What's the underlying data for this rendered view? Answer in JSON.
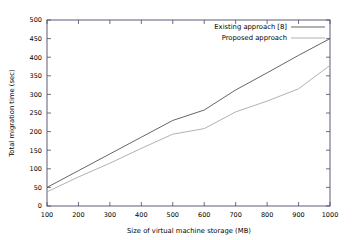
{
  "chart_data": {
    "type": "line",
    "title": "",
    "xlabel": "Size of virtual machine storage (MB)",
    "ylabel": "Total migration time (sec)",
    "x": [
      100,
      200,
      300,
      400,
      500,
      600,
      700,
      800,
      900,
      1000
    ],
    "xlim": [
      100,
      1000
    ],
    "ylim": [
      0,
      500
    ],
    "xticks": [
      "100",
      "200",
      "300",
      "400",
      "500",
      "600",
      "700",
      "800",
      "900",
      "1000"
    ],
    "yticks": [
      "0",
      "50",
      "100",
      "150",
      "200",
      "250",
      "300",
      "350",
      "400",
      "450",
      "500"
    ],
    "grid": false,
    "legend_position": "top-right-inside",
    "series": [
      {
        "name": "Existing approach [8]",
        "color": "#555555",
        "values": [
          50,
          95,
          140,
          185,
          230,
          258,
          312,
          358,
          405,
          450
        ]
      },
      {
        "name": "Proposed approach",
        "color": "#a8a8a8",
        "values": [
          38,
          78,
          115,
          155,
          193,
          208,
          253,
          282,
          315,
          378
        ]
      }
    ]
  },
  "axis": {
    "x_title": "Size of virtual machine storage (MB)",
    "y_title": "Total migration time (sec)"
  },
  "legend": {
    "entries": [
      {
        "label": "Existing approach [8]"
      },
      {
        "label": "Proposed approach"
      }
    ]
  },
  "colors": {
    "series_existing": "#555555",
    "series_proposed": "#a8a8a8",
    "frame": "#4a4a6a",
    "text": "#000000",
    "background": "#ffffff"
  }
}
